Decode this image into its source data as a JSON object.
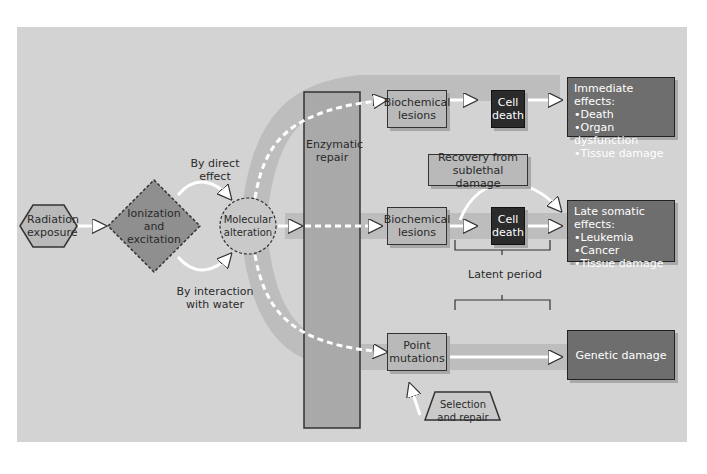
{
  "diagram": {
    "nodes": {
      "radiation_exposure": "Radiation exposure",
      "ionization": "Ionization and excitation",
      "molecular_alteration": "Molecular alteration",
      "enzymatic_repair": "Enzymatic repair",
      "biochemical_lesions_top": "Biochemical lesions",
      "cell_death_top": "Cell death",
      "biochemical_lesions_mid": "Biochemical lesions",
      "cell_death_mid": "Cell death",
      "point_mutations": "Point mutations",
      "recovery": "Recovery from sublethal damage",
      "selection_repair": "Selection and repair",
      "latent_period": "Latent period",
      "genetic_damage": "Genetic damage"
    },
    "edge_labels": {
      "direct": "By direct effect",
      "water": "By interaction with water"
    },
    "immediate_effects": {
      "title": "Immediate effects:",
      "items": [
        "Death",
        "Organ dysfunction",
        "Tissue damage"
      ]
    },
    "late_effects": {
      "title": "Late somatic effects:",
      "items": [
        "Leukemia",
        "Cancer",
        "Tissue damage"
      ]
    },
    "colors": {
      "background": "#d3d3d3",
      "band": "#bdbdbd",
      "box_light": "#b9b9b9",
      "box_dark": "#2b2b2b",
      "effect_box": "#6e6e6e"
    }
  }
}
